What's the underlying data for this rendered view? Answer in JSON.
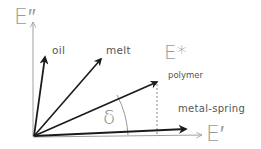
{
  "diagram": {
    "type": "phasor-vector-diagram",
    "axes": {
      "y": {
        "label": "E″"
      },
      "x": {
        "label": "E′"
      }
    },
    "vectors": [
      {
        "id": "oil",
        "label": "oil"
      },
      {
        "id": "melt",
        "label": "melt"
      },
      {
        "id": "polymer",
        "label": "E*",
        "sublabel": "polymer"
      },
      {
        "id": "metal-spring",
        "label": "metal-spring"
      }
    ],
    "angle": {
      "label": "δ"
    }
  },
  "colors": {
    "axis": "#a0a0a0",
    "vector": "#1a1a1a",
    "label": "#555555",
    "axis_label": "#9a9a9a"
  }
}
